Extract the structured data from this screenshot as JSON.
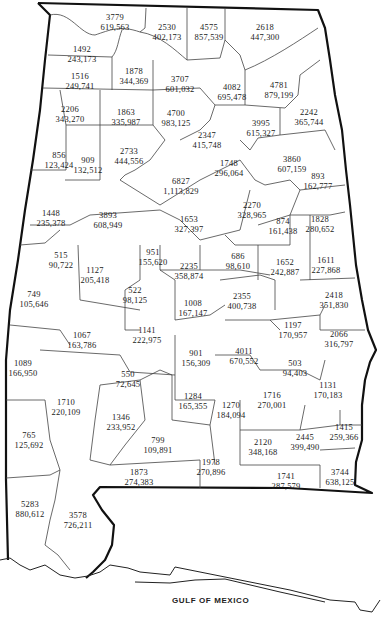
{
  "map": {
    "title": "Alabama counties",
    "water_label": "GULF OF MEXICO",
    "line_color": "#111111",
    "background": "#ffffff"
  },
  "counties": [
    {
      "top": "3779",
      "bottom": "619,563",
      "x": 115,
      "y": 12
    },
    {
      "top": "2530",
      "bottom": "402,173",
      "x": 167,
      "y": 22
    },
    {
      "top": "4575",
      "bottom": "857,539",
      "x": 209,
      "y": 22
    },
    {
      "top": "2618",
      "bottom": "447,300",
      "x": 265,
      "y": 22
    },
    {
      "top": "1492",
      "bottom": "243,173",
      "x": 82,
      "y": 44
    },
    {
      "top": "1516",
      "bottom": "249,741",
      "x": 80,
      "y": 71
    },
    {
      "top": "1878",
      "bottom": "344,369",
      "x": 134,
      "y": 66
    },
    {
      "top": "3707",
      "bottom": "601,032",
      "x": 180,
      "y": 74
    },
    {
      "top": "4082",
      "bottom": "695,478",
      "x": 232,
      "y": 82
    },
    {
      "top": "4781",
      "bottom": "879,199",
      "x": 279,
      "y": 80
    },
    {
      "top": "2206",
      "bottom": "343,270",
      "x": 70,
      "y": 104
    },
    {
      "top": "1863",
      "bottom": "335,987",
      "x": 126,
      "y": 107
    },
    {
      "top": "4700",
      "bottom": "983,125",
      "x": 176,
      "y": 108
    },
    {
      "top": "2242",
      "bottom": "365,744",
      "x": 309,
      "y": 107
    },
    {
      "top": "2347",
      "bottom": "415,748",
      "x": 207,
      "y": 130
    },
    {
      "top": "3995",
      "bottom": "615,327",
      "x": 261,
      "y": 118
    },
    {
      "top": "856",
      "bottom": "123,424",
      "x": 59,
      "y": 150
    },
    {
      "top": "909",
      "bottom": "132,512",
      "x": 88,
      "y": 155
    },
    {
      "top": "2733",
      "bottom": "444,556",
      "x": 129,
      "y": 146
    },
    {
      "top": "1748",
      "bottom": "296,064",
      "x": 229,
      "y": 158
    },
    {
      "top": "3860",
      "bottom": "607,159",
      "x": 292,
      "y": 154
    },
    {
      "top": "6827",
      "bottom": "1,113,829",
      "x": 181,
      "y": 176
    },
    {
      "top": "893",
      "bottom": "162,777",
      "x": 318,
      "y": 171
    },
    {
      "top": "1448",
      "bottom": "235,378",
      "x": 51,
      "y": 208
    },
    {
      "top": "3893",
      "bottom": "608,949",
      "x": 108,
      "y": 210
    },
    {
      "top": "2270",
      "bottom": "328,965",
      "x": 252,
      "y": 200
    },
    {
      "top": "1653",
      "bottom": "327,397",
      "x": 189,
      "y": 214
    },
    {
      "top": "874",
      "bottom": "161,438",
      "x": 283,
      "y": 216
    },
    {
      "top": "1828",
      "bottom": "280,652",
      "x": 320,
      "y": 214
    },
    {
      "top": "515",
      "bottom": "90,722",
      "x": 61,
      "y": 250
    },
    {
      "top": "951",
      "bottom": "155,620",
      "x": 153,
      "y": 247
    },
    {
      "top": "749",
      "bottom": "105,646",
      "x": 34,
      "y": 289
    },
    {
      "top": "1127",
      "bottom": "205,418",
      "x": 95,
      "y": 265
    },
    {
      "top": "2235",
      "bottom": "358,874",
      "x": 189,
      "y": 261
    },
    {
      "top": "686",
      "bottom": "98,610",
      "x": 238,
      "y": 251
    },
    {
      "top": "1652",
      "bottom": "242,887",
      "x": 285,
      "y": 257
    },
    {
      "top": "1611",
      "bottom": "227,868",
      "x": 326,
      "y": 255
    },
    {
      "top": "522",
      "bottom": "98,125",
      "x": 135,
      "y": 285
    },
    {
      "top": "1008",
      "bottom": "167,147",
      "x": 193,
      "y": 298
    },
    {
      "top": "2355",
      "bottom": "400,738",
      "x": 242,
      "y": 291
    },
    {
      "top": "2418",
      "bottom": "351,830",
      "x": 334,
      "y": 290
    },
    {
      "top": "1067",
      "bottom": "163,786",
      "x": 82,
      "y": 330
    },
    {
      "top": "1141",
      "bottom": "222,975",
      "x": 147,
      "y": 325
    },
    {
      "top": "1197",
      "bottom": "170,957",
      "x": 293,
      "y": 320
    },
    {
      "top": "2066",
      "bottom": "316,797",
      "x": 339,
      "y": 329
    },
    {
      "top": "901",
      "bottom": "156,309",
      "x": 196,
      "y": 348
    },
    {
      "top": "4011",
      "bottom": "670,552",
      "x": 244,
      "y": 346
    },
    {
      "top": "1089",
      "bottom": "166,950",
      "x": 23,
      "y": 358
    },
    {
      "top": "503",
      "bottom": "94,403",
      "x": 295,
      "y": 358
    },
    {
      "top": "550",
      "bottom": "72,645",
      "x": 128,
      "y": 369
    },
    {
      "top": "1131",
      "bottom": "170,183",
      "x": 328,
      "y": 380
    },
    {
      "top": "1284",
      "bottom": "165,355",
      "x": 193,
      "y": 391
    },
    {
      "top": "1710",
      "bottom": "220,109",
      "x": 66,
      "y": 397
    },
    {
      "top": "1716",
      "bottom": "270,001",
      "x": 272,
      "y": 390
    },
    {
      "top": "1270",
      "bottom": "184,094",
      "x": 231,
      "y": 400
    },
    {
      "top": "1346",
      "bottom": "233,952",
      "x": 121,
      "y": 412
    },
    {
      "top": "765",
      "bottom": "125,692",
      "x": 29,
      "y": 430
    },
    {
      "top": "1415",
      "bottom": "259,366",
      "x": 344,
      "y": 422
    },
    {
      "top": "799",
      "bottom": "109,891",
      "x": 158,
      "y": 435
    },
    {
      "top": "2120",
      "bottom": "348,168",
      "x": 263,
      "y": 437
    },
    {
      "top": "2445",
      "bottom": "399,490",
      "x": 305,
      "y": 432
    },
    {
      "top": "1978",
      "bottom": "270,896",
      "x": 211,
      "y": 457
    },
    {
      "top": "1873",
      "bottom": "274,383",
      "x": 139,
      "y": 467
    },
    {
      "top": "1741",
      "bottom": "287,579",
      "x": 286,
      "y": 471
    },
    {
      "top": "3744",
      "bottom": "638,125",
      "x": 340,
      "y": 467
    },
    {
      "top": "5283",
      "bottom": "880,612",
      "x": 30,
      "y": 499
    },
    {
      "top": "3578",
      "bottom": "726,211",
      "x": 78,
      "y": 510
    }
  ]
}
